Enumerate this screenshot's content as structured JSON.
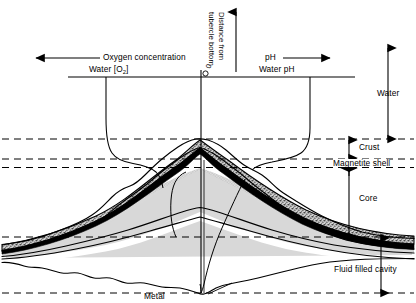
{
  "figure": {
    "axes": {
      "oxygen": {
        "label": "Oxygen concentration",
        "arrow_direction": "left"
      },
      "water_o2": {
        "label": "Water [O",
        "sub": "2",
        "label_end": "]"
      },
      "ph": {
        "label": "pH",
        "arrow_direction": "right"
      },
      "water_ph": {
        "label": "Water pH"
      },
      "vertical": {
        "label": "Distance from",
        "label2": "tubercle bottom",
        "origin_marker": "0",
        "arrow_direction": "up"
      }
    },
    "layers": [
      {
        "name": "water",
        "label": "Water"
      },
      {
        "name": "crust",
        "label": "Crust"
      },
      {
        "name": "magnetite-shell",
        "label": "Magnetite shell"
      },
      {
        "name": "core",
        "label": "Core"
      },
      {
        "name": "fluid-filled-cavity",
        "label": "Fluid filled cavity"
      },
      {
        "name": "metal",
        "label": "Metal"
      }
    ],
    "colors": {
      "line": "#000000",
      "crust_fill": "#b9b9b9",
      "core_fill": "#d6d6d6",
      "cavity_fill": "#ffffff",
      "shell_fill": "#000000",
      "background": "#ffffff"
    }
  }
}
